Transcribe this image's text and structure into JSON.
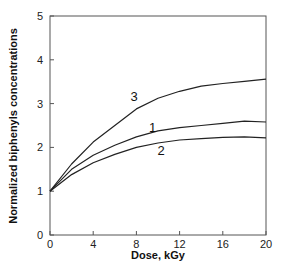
{
  "chart_data": {
    "type": "line",
    "title": "",
    "xlabel": "Dose, kGy",
    "ylabel": "Normalized biphenyls concentrations",
    "xlim": [
      0,
      20
    ],
    "ylim": [
      0,
      5
    ],
    "xticks": [
      0,
      4,
      8,
      12,
      16,
      20
    ],
    "yticks": [
      0,
      1,
      2,
      3,
      4,
      5
    ],
    "grid": false,
    "legend": "inline curve labels",
    "series": [
      {
        "name": "1",
        "label_pos": [
          9.5,
          2.35
        ],
        "x": [
          0,
          2,
          4,
          6,
          8,
          10,
          12,
          14,
          16,
          18,
          20
        ],
        "values": [
          1.0,
          1.5,
          1.82,
          2.05,
          2.24,
          2.38,
          2.45,
          2.5,
          2.55,
          2.6,
          2.58
        ]
      },
      {
        "name": "2",
        "label_pos": [
          10.3,
          1.82
        ],
        "x": [
          0,
          2,
          4,
          6,
          8,
          10,
          12,
          14,
          16,
          18,
          20
        ],
        "values": [
          1.0,
          1.38,
          1.65,
          1.84,
          2.0,
          2.1,
          2.17,
          2.2,
          2.23,
          2.24,
          2.22
        ]
      },
      {
        "name": "3",
        "label_pos": [
          7.8,
          3.05
        ],
        "x": [
          0,
          2,
          4,
          6,
          8,
          10,
          12,
          14,
          16,
          18,
          20
        ],
        "values": [
          1.0,
          1.62,
          2.12,
          2.5,
          2.88,
          3.12,
          3.28,
          3.4,
          3.46,
          3.51,
          3.56
        ]
      }
    ]
  }
}
